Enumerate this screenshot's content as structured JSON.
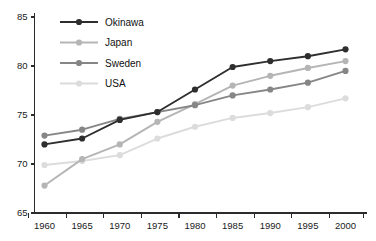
{
  "chart_data": {
    "type": "line",
    "title": "",
    "xlabel": "",
    "ylabel": "",
    "x": [
      1960,
      1965,
      1970,
      1975,
      1980,
      1985,
      1990,
      1995,
      2000
    ],
    "xticklabels": [
      "1960",
      "1965",
      "1970",
      "1975",
      "1980",
      "1985",
      "1990",
      "1995",
      "2000"
    ],
    "yticks": [
      65,
      70,
      75,
      80,
      85
    ],
    "yticklabels": [
      "65",
      "70",
      "75",
      "80",
      "85"
    ],
    "ylim": [
      65,
      85
    ],
    "xlim": [
      1958,
      2002
    ],
    "grid": false,
    "legend_position": "top-left",
    "series": [
      {
        "name": "Okinawa",
        "color": "#2e2e2e",
        "marker": "circle",
        "values": [
          72.0,
          72.6,
          74.5,
          75.3,
          77.6,
          79.9,
          80.5,
          81.0,
          81.7
        ]
      },
      {
        "name": "Japan",
        "color": "#b5b5b5",
        "marker": "circle",
        "values": [
          67.8,
          70.5,
          72.0,
          74.3,
          76.1,
          78.0,
          79.0,
          79.8,
          80.5
        ]
      },
      {
        "name": "Sweden",
        "color": "#868686",
        "marker": "circle",
        "values": [
          72.9,
          73.5,
          74.6,
          75.3,
          76.0,
          77.0,
          77.6,
          78.3,
          79.5
        ]
      },
      {
        "name": "USA",
        "color": "#dcdcdc",
        "marker": "circle",
        "values": [
          69.9,
          70.3,
          70.9,
          72.6,
          73.8,
          74.7,
          75.2,
          75.8,
          76.7
        ]
      }
    ]
  },
  "legend": {
    "entries": [
      {
        "label": "Okinawa",
        "color": "#2e2e2e"
      },
      {
        "label": "Japan",
        "color": "#b5b5b5"
      },
      {
        "label": "Sweden",
        "color": "#868686"
      },
      {
        "label": "USA",
        "color": "#dcdcdc"
      }
    ]
  },
  "axes": {
    "y_tick_labels": [
      "85",
      "80",
      "75",
      "70",
      "65"
    ],
    "x_tick_labels": [
      "1960",
      "1965",
      "1970",
      "1975",
      "1980",
      "1985",
      "1990",
      "1995",
      "2000"
    ]
  }
}
